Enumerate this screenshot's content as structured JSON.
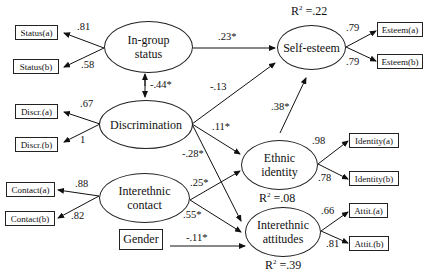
{
  "indicators": {
    "status_a": "Status(a)",
    "status_b": "Status(b)",
    "discr_a": "Discr.(a)",
    "discr_b": "Discr.(b)",
    "contact_a": "Contact(a)",
    "contact_b": "Contact(b)",
    "esteem_a": "Esteem(a)",
    "esteem_b": "Esteem(b)",
    "identity_a": "Identity(a)",
    "identity_b": "Identity(b)",
    "attit_a": "Attit.(a)",
    "attit_b": "Attit.(b)",
    "gender": "Gender"
  },
  "latents": {
    "ingroup_status": "In-group status",
    "discrimination": "Discrimination",
    "interethnic_contact": "Interethnic contact",
    "self_esteem": "Self-esteem",
    "ethnic_identity": "Ethnic identity",
    "interethnic_attitudes": "Interethnic attitudes"
  },
  "loadings": {
    "status_a": ".81",
    "status_b": ".58",
    "discr_a": ".67",
    "discr_b": "1",
    "contact_a": ".88",
    "contact_b": ".82",
    "esteem_a": ".79",
    "esteem_b": ".79",
    "identity_a": ".98",
    "identity_b": ".78",
    "attit_a": ".66",
    "attit_b": ".81"
  },
  "paths": {
    "status_esteem": ".23*",
    "status_discr_cov": "-.44*",
    "discr_esteem": "-.13",
    "discr_identity": ".11*",
    "discr_attitudes": "-.28*",
    "identity_esteem": ".38*",
    "contact_identity": ".25*",
    "contact_attitudes": ".55*",
    "gender_attitudes": "-.11*"
  },
  "r_squared": {
    "self_esteem": ".22",
    "ethnic_identity": ".08",
    "interethnic_attitudes": ".39"
  },
  "r2_prefix": "R",
  "r2_sup": "2",
  "r2_eq": " =",
  "latent_lines": {
    "ingroup_1": "In-group",
    "ingroup_2": "status",
    "contact_1": "Interethnic",
    "contact_2": "contact",
    "identity_1": "Ethnic",
    "identity_2": "identity",
    "attit_1": "Interethnic",
    "attit_2": "attitudes"
  }
}
